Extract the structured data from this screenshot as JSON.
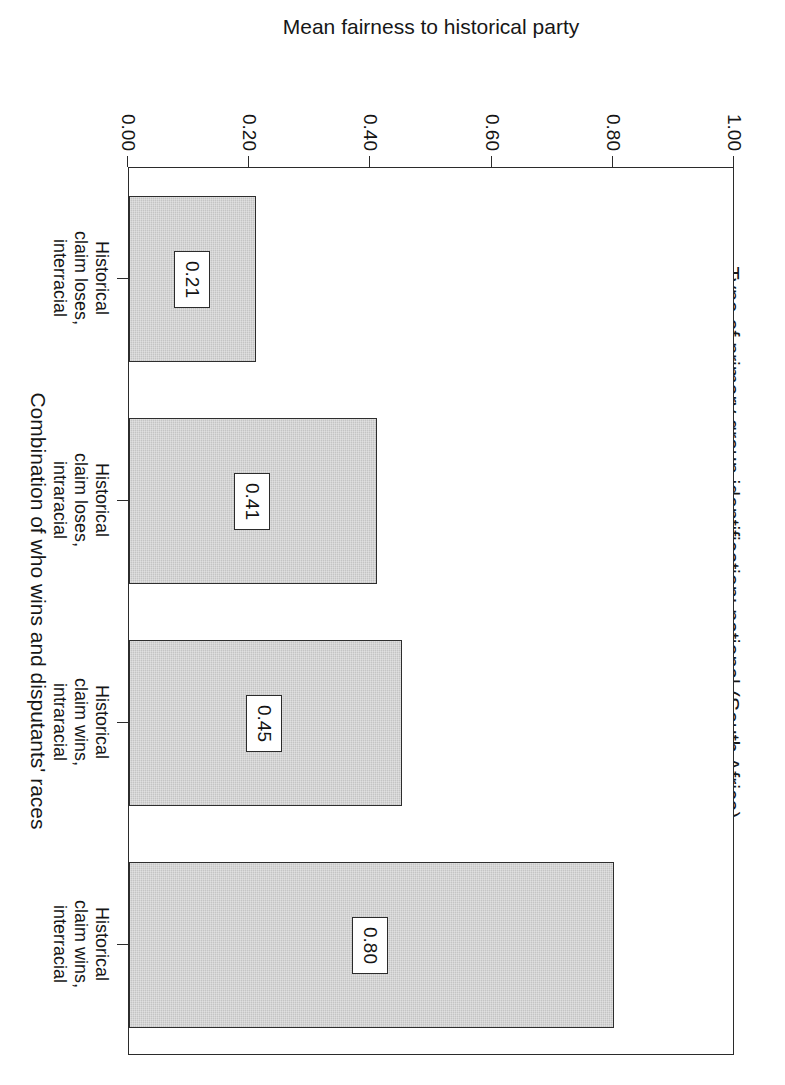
{
  "chart_data": {
    "type": "bar",
    "orientation": "vertical",
    "title": "Type of primary group identification: national (South Africa)",
    "xlabel": "Combination of who wins and disputants' races",
    "ylabel": "Mean fairness to historical party",
    "categories": [
      "Historical claim loses, interracial",
      "Historical claim loses, intraracial",
      "Historical claim wins, intraracial",
      "Historical claim wins, interracial"
    ],
    "category_lines": [
      [
        "Historical",
        "claim loses,",
        "interracial"
      ],
      [
        "Historical",
        "claim loses,",
        "intraracial"
      ],
      [
        "Historical",
        "claim wins,",
        "intraracial"
      ],
      [
        "Historical",
        "claim wins,",
        "interracial"
      ]
    ],
    "values": [
      0.21,
      0.41,
      0.45,
      0.8
    ],
    "value_labels": [
      "0.21",
      "0.41",
      "0.45",
      "0.80"
    ],
    "ylim": [
      0.0,
      1.0
    ],
    "yticks": [
      0.0,
      0.2,
      0.4,
      0.6,
      0.8,
      1.0
    ],
    "ytick_labels": [
      "0.00",
      "0.20",
      "0.40",
      "0.60",
      "0.80",
      "1.00"
    ],
    "grid": false,
    "legend": false,
    "bar_color": "#c4c4c4",
    "bar_border_color": "#2e2e2e",
    "axis_color": "#2b2b2b",
    "text_color": "#141414",
    "background": "#ffffff",
    "rotation_deg": 90
  },
  "figure": {
    "title": "Type of primary group identification: national (South Africa)",
    "value_axis_title": "Mean fairness to historical party",
    "category_axis_title": "Combination of who wins and disputants' races"
  },
  "ticks": {
    "y": [
      {
        "label": "0.00",
        "value": 0.0
      },
      {
        "label": "0.20",
        "value": 0.2
      },
      {
        "label": "0.40",
        "value": 0.4
      },
      {
        "label": "0.60",
        "value": 0.6
      },
      {
        "label": "0.80",
        "value": 0.8
      },
      {
        "label": "1.00",
        "value": 1.0
      }
    ]
  },
  "bars": [
    {
      "label_line1": "Historical",
      "label_line2": "claim loses,",
      "label_line3": "interracial",
      "value": 0.21,
      "value_label": "0.21"
    },
    {
      "label_line1": "Historical",
      "label_line2": "claim loses,",
      "label_line3": "intraracial",
      "value": 0.41,
      "value_label": "0.41"
    },
    {
      "label_line1": "Historical",
      "label_line2": "claim wins,",
      "label_line3": "intraracial",
      "value": 0.45,
      "value_label": "0.45"
    },
    {
      "label_line1": "Historical",
      "label_line2": "claim wins,",
      "label_line3": "interracial",
      "value": 0.8,
      "value_label": "0.80"
    }
  ]
}
